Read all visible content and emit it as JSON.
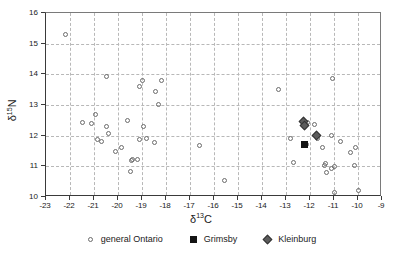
{
  "chart_data": {
    "type": "scatter",
    "title": "",
    "xlabel": "δ¹³C",
    "ylabel": "δ¹⁵N",
    "xlabel_base": "δ",
    "xlabel_sup": "13",
    "xlabel_tail": "C",
    "ylabel_base": "δ",
    "ylabel_sup": "15",
    "ylabel_tail": "N",
    "xlim": [
      -23,
      -9
    ],
    "ylim": [
      10,
      16
    ],
    "xticks": [
      -23,
      -22,
      -21,
      -20,
      -19,
      -18,
      -17,
      -16,
      -15,
      -14,
      -13,
      -12,
      -11,
      -10,
      -9
    ],
    "yticks": [
      10,
      11,
      12,
      13,
      14,
      15,
      16
    ],
    "grid": true,
    "grid_style": "dashed",
    "legend_position": "below",
    "series": [
      {
        "name": "general Ontario",
        "marker": "open-circle",
        "color": "#6b6b6b",
        "points": [
          [
            -22.2,
            15.3
          ],
          [
            -21.5,
            12.42
          ],
          [
            -21.1,
            12.4
          ],
          [
            -20.95,
            12.68
          ],
          [
            -20.85,
            11.88
          ],
          [
            -20.7,
            11.8
          ],
          [
            -20.5,
            13.93
          ],
          [
            -20.5,
            12.3
          ],
          [
            -20.4,
            12.07
          ],
          [
            -20.1,
            11.5
          ],
          [
            -19.85,
            11.63
          ],
          [
            -19.6,
            12.5
          ],
          [
            -19.5,
            10.83
          ],
          [
            -19.45,
            11.2
          ],
          [
            -19.4,
            11.22
          ],
          [
            -19.2,
            11.23
          ],
          [
            -19.1,
            13.6
          ],
          [
            -19.1,
            11.88
          ],
          [
            -19.0,
            13.8
          ],
          [
            -18.95,
            12.3
          ],
          [
            -18.8,
            11.9
          ],
          [
            -18.5,
            11.78
          ],
          [
            -18.45,
            13.43
          ],
          [
            -18.3,
            13.02
          ],
          [
            -18.2,
            13.8
          ],
          [
            -16.6,
            11.68
          ],
          [
            -15.55,
            10.55
          ],
          [
            -13.3,
            13.52
          ],
          [
            -12.8,
            11.92
          ],
          [
            -12.7,
            11.12
          ],
          [
            -12.2,
            12.35
          ],
          [
            -12.1,
            12.43
          ],
          [
            -12.15,
            11.72
          ],
          [
            -11.8,
            12.38
          ],
          [
            -11.7,
            11.9
          ],
          [
            -11.5,
            11.6
          ],
          [
            -11.4,
            11.03
          ],
          [
            -11.35,
            11.08
          ],
          [
            -11.3,
            10.8
          ],
          [
            -11.1,
            12.02
          ],
          [
            -11.1,
            10.93
          ],
          [
            -11.0,
            10.98
          ],
          [
            -11.0,
            10.15
          ],
          [
            -10.75,
            11.82
          ],
          [
            -10.3,
            11.45
          ],
          [
            -10.15,
            11.02
          ],
          [
            -10.1,
            11.63
          ],
          [
            -10.0,
            10.22
          ],
          [
            -11.05,
            13.88
          ]
        ]
      },
      {
        "name": "Grimsby",
        "marker": "filled-square",
        "color": "#141414",
        "points": [
          [
            -12.25,
            11.7
          ]
        ]
      },
      {
        "name": "Kleinburg",
        "marker": "filled-diamond",
        "color": "#5c5c5c",
        "points": [
          [
            -12.25,
            12.45
          ],
          [
            -12.22,
            12.33
          ],
          [
            -11.72,
            11.98
          ]
        ]
      }
    ]
  },
  "legend": {
    "items": [
      {
        "label": "general Ontario",
        "marker": "open-circle"
      },
      {
        "label": "Grimsby",
        "marker": "filled-square"
      },
      {
        "label": "Kleinburg",
        "marker": "filled-diamond"
      }
    ]
  },
  "colors": {
    "axis": "#3a3a3a",
    "grid": "#b8b8b8",
    "circle_stroke": "#6b6b6b",
    "square_fill": "#141414",
    "diamond_fill": "#5c5c5c",
    "text": "#1a1a1a",
    "background": "#ffffff"
  }
}
